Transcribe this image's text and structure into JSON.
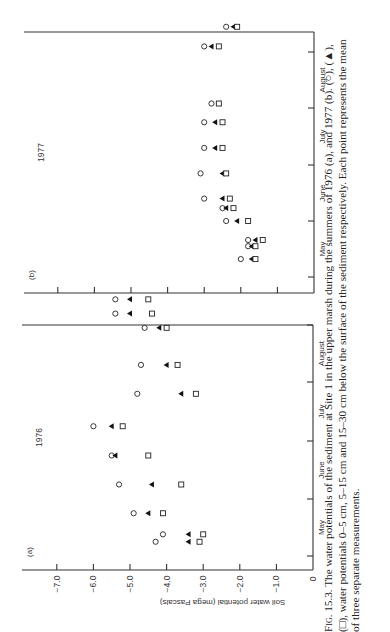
{
  "figure": {
    "caption_label": "Fig. 15.3.",
    "caption_text": "The water potentials of the sediment at Site 1 in the upper marsh during the summers of 1976 (a), and 1977 (b). (○), (▲), (□), water potentials 0–5 cm, 5–15 cm and 15–30 cm below the surface of the sediment respectively. Each point represents the mean of three separate measurements."
  },
  "chart_data": [
    {
      "type": "scatter",
      "panel": "(a)",
      "title": "1976",
      "xlabel": "",
      "ylabel": "Soil water potential (mega Pascals)",
      "ylim": [
        -7.5,
        0
      ],
      "y_ticks": [
        "-7.0",
        "-6.0",
        "-5.0",
        "-4.0",
        "-3.0",
        "-2.0",
        "-1.0",
        "0"
      ],
      "x_ticks": [
        "May",
        "June",
        "July",
        "August"
      ],
      "orientation": "rotated 90° counter-clockwise",
      "series": [
        {
          "name": "0–5 cm",
          "marker": "open-circle",
          "points": [
            [
              0.25,
              -4.3
            ],
            [
              0.38,
              -4.1
            ],
            [
              0.75,
              -4.9
            ],
            [
              1.25,
              -5.3
            ],
            [
              1.75,
              -5.5
            ],
            [
              2.25,
              -6.0
            ],
            [
              2.8,
              -4.8
            ],
            [
              3.3,
              -4.7
            ],
            [
              3.95,
              -4.6
            ],
            [
              4.2,
              -5.4
            ],
            [
              4.45,
              -5.4
            ]
          ]
        },
        {
          "name": "5–15 cm",
          "marker": "filled-triangle",
          "points": [
            [
              0.25,
              -3.4
            ],
            [
              0.38,
              -3.4
            ],
            [
              0.75,
              -4.5
            ],
            [
              1.25,
              -4.4
            ],
            [
              1.75,
              -5.4
            ],
            [
              2.25,
              -5.5
            ],
            [
              2.8,
              -3.6
            ],
            [
              3.3,
              -4.0
            ],
            [
              3.95,
              -4.2
            ],
            [
              4.2,
              -5.0
            ],
            [
              4.45,
              -5.0
            ]
          ]
        },
        {
          "name": "15–30 cm",
          "marker": "open-square",
          "points": [
            [
              0.25,
              -3.1
            ],
            [
              0.38,
              -3.0
            ],
            [
              0.75,
              -4.1
            ],
            [
              1.25,
              -3.6
            ],
            [
              1.75,
              -4.5
            ],
            [
              2.25,
              -5.2
            ],
            [
              2.8,
              -3.2
            ],
            [
              3.3,
              -3.7
            ],
            [
              3.95,
              -4.0
            ],
            [
              4.2,
              -4.4
            ],
            [
              4.45,
              -4.5
            ]
          ]
        }
      ]
    },
    {
      "type": "scatter",
      "panel": "(b)",
      "title": "1977",
      "xlabel": "",
      "ylabel": "Soil water potential (mega Pascals)",
      "ylim": [
        -7.5,
        0
      ],
      "x_ticks": [
        "May",
        "June",
        "July",
        "August"
      ],
      "orientation": "rotated 90° counter-clockwise",
      "series": [
        {
          "name": "0–5 cm",
          "marker": "open-circle",
          "points": [
            [
              0.32,
              -2.0
            ],
            [
              0.55,
              -1.8
            ],
            [
              0.66,
              -1.8
            ],
            [
              1.0,
              -2.4
            ],
            [
              1.23,
              -2.5
            ],
            [
              1.4,
              -3.0
            ],
            [
              1.85,
              -3.1
            ],
            [
              2.3,
              -3.0
            ],
            [
              2.75,
              -3.0
            ],
            [
              3.08,
              -2.8
            ],
            [
              4.1,
              -3.0
            ],
            [
              4.45,
              -2.4
            ]
          ]
        },
        {
          "name": "5–15 cm",
          "marker": "filled-triangle",
          "points": [
            [
              0.32,
              -1.7
            ],
            [
              0.55,
              -1.7
            ],
            [
              0.66,
              -1.6
            ],
            [
              1.0,
              -2.1
            ],
            [
              1.23,
              -2.4
            ],
            [
              1.4,
              -2.5
            ],
            [
              1.85,
              -2.5
            ],
            [
              2.3,
              -2.7
            ],
            [
              2.75,
              -2.7
            ],
            [
              3.08,
              -2.6
            ],
            [
              4.1,
              -2.8
            ],
            [
              4.45,
              -2.2
            ]
          ]
        },
        {
          "name": "15–30 cm",
          "marker": "open-square",
          "points": [
            [
              0.32,
              -1.6
            ],
            [
              0.55,
              -1.6
            ],
            [
              0.66,
              -1.4
            ],
            [
              1.0,
              -1.8
            ],
            [
              1.23,
              -2.2
            ],
            [
              1.4,
              -2.3
            ],
            [
              1.85,
              -2.4
            ],
            [
              2.3,
              -2.5
            ],
            [
              2.75,
              -2.5
            ],
            [
              3.08,
              -2.6
            ],
            [
              4.1,
              -2.6
            ],
            [
              4.45,
              -2.1
            ]
          ]
        }
      ]
    }
  ],
  "panels": {
    "a": {
      "label": "(a)",
      "year": "1976"
    },
    "b": {
      "label": "(b)",
      "year": "1977"
    }
  },
  "axis": {
    "ylabel": "Soil water potential (mega Pascals)",
    "ticks": [
      "-7.0",
      "-6.0",
      "-5.0",
      "-4.0",
      "-3.0",
      "-2.0",
      "-1.0",
      "0"
    ],
    "months": [
      "May",
      "June",
      "July",
      "August"
    ]
  }
}
